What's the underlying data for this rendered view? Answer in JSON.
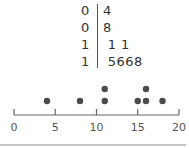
{
  "stem_leaf": {
    "rows": [
      {
        "stem": "0",
        "leaves": "4"
      },
      {
        "stem": "0",
        "leaves": "8"
      },
      {
        "stem": "1",
        "leaves": " 1 1"
      },
      {
        "stem": "1",
        "leaves": " 5668"
      }
    ]
  },
  "chart_data": {
    "type": "scatter",
    "subtype": "dot_plot",
    "title": "",
    "xlabel": "",
    "ylabel": "",
    "xlim": [
      0,
      20
    ],
    "x_ticks": [
      0,
      5,
      10,
      15,
      20
    ],
    "tick_labels": [
      "0",
      "5",
      "10",
      "15",
      "20"
    ],
    "grid": false,
    "legend": null,
    "values": [
      4,
      8,
      11,
      11,
      15,
      16,
      16,
      18
    ],
    "points": [
      {
        "x": 4,
        "count": 1
      },
      {
        "x": 8,
        "count": 1
      },
      {
        "x": 11,
        "count": 2
      },
      {
        "x": 15,
        "count": 1
      },
      {
        "x": 16,
        "count": 2
      },
      {
        "x": 18,
        "count": 1
      }
    ],
    "stem_and_leaf": [
      {
        "stem": 0,
        "leaves": [
          4
        ]
      },
      {
        "stem": 0,
        "leaves": [
          8
        ]
      },
      {
        "stem": 1,
        "leaves": [
          1,
          1
        ]
      },
      {
        "stem": 1,
        "leaves": [
          5,
          6,
          6,
          8
        ]
      }
    ]
  },
  "colors": {
    "dot": "#4a4a4a",
    "axis": "#666666",
    "text": "#333333",
    "rule": "#888888"
  }
}
